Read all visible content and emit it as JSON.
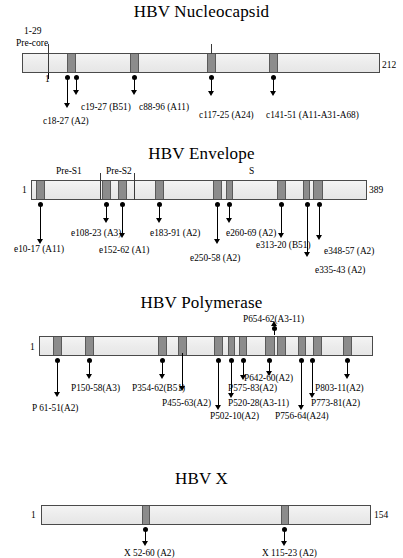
{
  "figure": {
    "type": "protein-epitope-map"
  },
  "panels": [
    {
      "id": "nucleocapsid",
      "title": "HBV Nucleocapsid",
      "start_label": "1",
      "end_label": "212",
      "length": 212,
      "domains": [
        {
          "name": "Pre-core",
          "range_label": "1-29"
        }
      ],
      "epitopes": [
        {
          "label": "c18-27 (A2)",
          "start": 18,
          "end": 27,
          "hla": "A2"
        },
        {
          "label": "c19-27 (B51)",
          "start": 19,
          "end": 27,
          "hla": "B51"
        },
        {
          "label": "c88-96 (A11)",
          "start": 88,
          "end": 96,
          "hla": "A11"
        },
        {
          "label": "c117-25 (A24)",
          "start": 117,
          "end": 125,
          "hla": "A24"
        },
        {
          "label": "c141-51 (A11-A31-A68)",
          "start": 141,
          "end": 151,
          "hla": "A11-A31-A68"
        }
      ]
    },
    {
      "id": "envelope",
      "title": "HBV Envelope",
      "start_label": "1",
      "end_label": "389",
      "length": 389,
      "domains": [
        {
          "name": "Pre-S1"
        },
        {
          "name": "Pre-S2"
        },
        {
          "name": "S"
        }
      ],
      "epitopes": [
        {
          "label": "e10-17 (A11)",
          "start": 10,
          "end": 17,
          "hla": "A11"
        },
        {
          "label": "e108-23 (A3)",
          "start": 108,
          "end": 123,
          "hla": "A3"
        },
        {
          "label": "e152-62 (A1)",
          "start": 152,
          "end": 162,
          "hla": "A1"
        },
        {
          "label": "e183-91 (A2)",
          "start": 183,
          "end": 191,
          "hla": "A2"
        },
        {
          "label": "e250-58 (A2)",
          "start": 250,
          "end": 258,
          "hla": "A2"
        },
        {
          "label": "e260-69 (A2)",
          "start": 260,
          "end": 269,
          "hla": "A2"
        },
        {
          "label": "e313-20 (B51)",
          "start": 313,
          "end": 320,
          "hla": "B51"
        },
        {
          "label": "e335-43 (A2)",
          "start": 335,
          "end": 343,
          "hla": "A2"
        },
        {
          "label": "e348-57 (A2)",
          "start": 348,
          "end": 357,
          "hla": "A2"
        }
      ]
    },
    {
      "id": "polymerase",
      "title": "HBV Polymerase",
      "start_label": "1",
      "end_label": "",
      "length": 845,
      "domains": [],
      "epitopes": [
        {
          "label": "P 61-51(A2)",
          "start": 61,
          "end": 69,
          "hla": "A2"
        },
        {
          "label": "P150-58(A3)",
          "start": 150,
          "end": 158,
          "hla": "A3"
        },
        {
          "label": "P354-62(B51)",
          "start": 354,
          "end": 362,
          "hla": "B51"
        },
        {
          "label": "P455-63(A2)",
          "start": 455,
          "end": 463,
          "hla": "A2"
        },
        {
          "label": "P502-10(A2)",
          "start": 502,
          "end": 510,
          "hla": "A2"
        },
        {
          "label": "P520-28(A3-11)",
          "start": 520,
          "end": 528,
          "hla": "A3-11"
        },
        {
          "label": "P575-83(A2)",
          "start": 575,
          "end": 583,
          "hla": "A2"
        },
        {
          "label": "P642-60(A2)",
          "start": 642,
          "end": 660,
          "hla": "A2"
        },
        {
          "label": "P654-62(A3-11)",
          "start": 654,
          "end": 662,
          "hla": "A3-11"
        },
        {
          "label": "P756-64(A24)",
          "start": 756,
          "end": 764,
          "hla": "A24"
        },
        {
          "label": "P773-81(A2)",
          "start": 773,
          "end": 781,
          "hla": "A2"
        },
        {
          "label": "P803-11(A2)",
          "start": 803,
          "end": 811,
          "hla": "A2"
        }
      ]
    },
    {
      "id": "x",
      "title": "HBV X",
      "start_label": "1",
      "end_label": "154",
      "length": 154,
      "domains": [],
      "epitopes": [
        {
          "label": "X 52-60 (A2)",
          "start": 52,
          "end": 60,
          "hla": "A2"
        },
        {
          "label": "X 115-23 (A2)",
          "start": 115,
          "end": 123,
          "hla": "A2"
        }
      ]
    }
  ]
}
